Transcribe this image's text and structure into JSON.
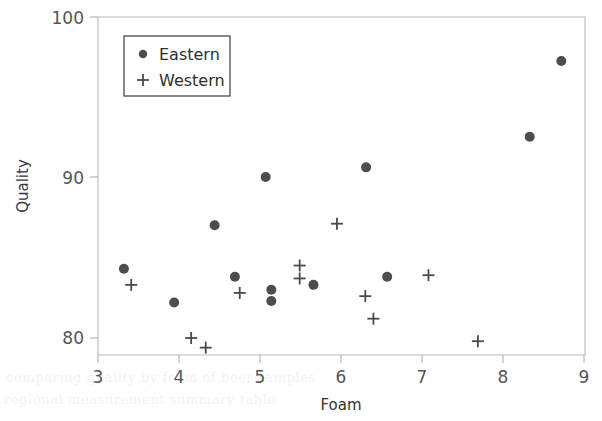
{
  "chart_data": {
    "type": "scatter",
    "title": "",
    "xlabel": "Foam",
    "ylabel": "Quality",
    "xlim": [
      3,
      9
    ],
    "ylim": [
      79,
      100
    ],
    "grid": false,
    "legend_position": "upper-left-inside",
    "xticks": [
      "3",
      "4",
      "5",
      "6",
      "7",
      "8",
      "9"
    ],
    "xtick_values": [
      3,
      4,
      5,
      6,
      7,
      8,
      9
    ],
    "yticks": [
      "80",
      "90",
      "100"
    ],
    "ytick_values": [
      80,
      90,
      100
    ],
    "series": [
      {
        "name": "Eastern",
        "marker": "filled-circle",
        "color": "#4d4d4d",
        "points": [
          {
            "x": 3.32,
            "y": 84.3
          },
          {
            "x": 3.94,
            "y": 82.2
          },
          {
            "x": 4.44,
            "y": 87.0
          },
          {
            "x": 4.69,
            "y": 83.8
          },
          {
            "x": 5.07,
            "y": 90.0
          },
          {
            "x": 5.14,
            "y": 83.0
          },
          {
            "x": 5.14,
            "y": 82.3
          },
          {
            "x": 5.66,
            "y": 83.3
          },
          {
            "x": 6.31,
            "y": 90.6
          },
          {
            "x": 6.57,
            "y": 83.8
          },
          {
            "x": 8.33,
            "y": 92.5
          },
          {
            "x": 8.72,
            "y": 97.2
          }
        ]
      },
      {
        "name": "Western",
        "marker": "plus",
        "color": "#4a4a4a",
        "points": [
          {
            "x": 3.41,
            "y": 83.3
          },
          {
            "x": 4.15,
            "y": 80.0
          },
          {
            "x": 4.33,
            "y": 79.4
          },
          {
            "x": 4.75,
            "y": 82.8
          },
          {
            "x": 5.49,
            "y": 84.5
          },
          {
            "x": 5.49,
            "y": 83.7
          },
          {
            "x": 5.95,
            "y": 87.1
          },
          {
            "x": 6.3,
            "y": 82.6
          },
          {
            "x": 6.4,
            "y": 81.2
          },
          {
            "x": 7.08,
            "y": 83.9
          },
          {
            "x": 7.69,
            "y": 79.8
          }
        ]
      }
    ]
  },
  "legend": {
    "entries": [
      {
        "label": "Eastern",
        "marker": "filled-circle"
      },
      {
        "label": "Western",
        "marker": "plus"
      }
    ]
  },
  "scan_artifacts": {
    "line_one": "comparing quality by foam of beer samples",
    "line_two": "regional measurement summary table"
  }
}
